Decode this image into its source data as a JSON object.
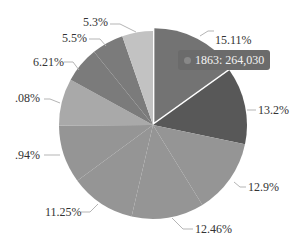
{
  "chart_data": {
    "type": "pie",
    "title": "",
    "center": [
      153,
      125
    ],
    "radius": 94,
    "start_angle_deg": 0,
    "direction": "clockwise",
    "slices": [
      {
        "label": "15.11%",
        "value": 15.11,
        "color": "#737373",
        "highlighted": true,
        "label_pos": [
          215,
          44
        ],
        "line": [
          [
            200,
            36
          ],
          [
            208,
            31
          ],
          [
            214,
            31
          ]
        ]
      },
      {
        "label": "13.2%",
        "value": 13.2,
        "color": "#585858",
        "label_pos": [
          258,
          114
        ],
        "line": [
          [
            247,
            110
          ],
          [
            256,
            110
          ]
        ]
      },
      {
        "label": "12.9%",
        "value": 12.9,
        "color": "#959595",
        "label_pos": [
          248,
          191
        ],
        "line": [
          [
            234,
            182
          ],
          [
            240,
            187
          ],
          [
            246,
            187
          ]
        ]
      },
      {
        "label": "12.46%",
        "value": 12.46,
        "color": "#959595",
        "label_pos": [
          195,
          233
        ],
        "line": [
          [
            172,
            218
          ],
          [
            183,
            229
          ],
          [
            193,
            229
          ]
        ]
      },
      {
        "label": "11.25%",
        "value": 11.25,
        "color": "#959595",
        "label_pos": [
          45,
          216
        ],
        "line": [
          [
            98,
            204
          ],
          [
            90,
            212
          ],
          [
            81,
            212
          ]
        ]
      },
      {
        "label": ".94%",
        "value": 10.0,
        "color": "#959595",
        "label_pos": [
          15,
          159
        ],
        "line": [
          [
            60,
            155
          ],
          [
            44,
            155
          ]
        ]
      },
      {
        "label": ".08%",
        "value": 8.1,
        "color": "#a9a9a9",
        "label_pos": [
          15,
          102
        ],
        "line": [
          [
            60,
            103
          ],
          [
            50,
            99
          ],
          [
            44,
            99
          ]
        ]
      },
      {
        "label": "6.21%",
        "value": 6.21,
        "color": "#7b7b7b",
        "label_pos": [
          33,
          66
        ],
        "line": [
          [
            79,
            70
          ],
          [
            73,
            62
          ],
          [
            64,
            62
          ]
        ]
      },
      {
        "label": "5.5%",
        "value": 5.5,
        "color": "#7b7b7b",
        "label_pos": [
          62,
          42
        ],
        "line": [
          [
            106,
            46
          ],
          [
            100,
            39
          ],
          [
            89,
            39
          ]
        ]
      },
      {
        "label": "5.3%",
        "value": 5.3,
        "color": "#c2c2c2",
        "label_pos": [
          83,
          26
        ],
        "line": [
          [
            136,
            32
          ],
          [
            120,
            24
          ],
          [
            110,
            24
          ]
        ]
      }
    ]
  },
  "tooltip": {
    "text": "1863: 264,030",
    "dot_color": "#888888"
  }
}
